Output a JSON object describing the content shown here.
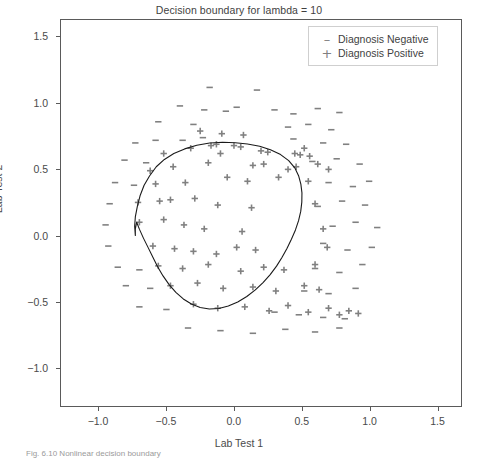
{
  "figure": {
    "width": 478,
    "height": 462,
    "background": "#ffffff",
    "caption": "Fig. 6.10  Nonlinear decision boundary"
  },
  "axis_labels": {
    "x": "Lab Test 1",
    "y": "Lab Test 2"
  },
  "legend": {
    "position": "upper-right",
    "entries": [
      {
        "marker": "minus-marker",
        "glyph": "–",
        "label": "Diagnosis Negative"
      },
      {
        "marker": "plus-marker",
        "glyph": "+",
        "label": "Diagnosis Positive"
      }
    ]
  },
  "colors": {
    "marker": "#808080",
    "boundary": "#1a1a1a",
    "frame": "#5a5a5a",
    "text": "#4a4a4a"
  },
  "chart_data": {
    "type": "scatter",
    "title": "Decision boundary for lambda = 10",
    "xlabel": "Lab Test 1",
    "ylabel": "Lab Test 2",
    "xlim": [
      -1.28,
      1.68
    ],
    "ylim": [
      -1.29,
      1.63
    ],
    "xticks": [
      -1.0,
      -0.5,
      0.0,
      0.5,
      1.0,
      1.5
    ],
    "xticklabels": [
      "−1.0",
      "−0.5",
      "0.0",
      "0.5",
      "1.0",
      "1.5"
    ],
    "yticks": [
      -1.0,
      -0.5,
      0.0,
      0.5,
      1.0,
      1.5
    ],
    "yticklabels": [
      "−1.0",
      "−0.5",
      "0.0",
      "0.5",
      "1.0",
      "1.5"
    ],
    "grid": false,
    "legend_position": "upper right",
    "series": [
      {
        "name": "Diagnosis Positive",
        "marker": "+",
        "color": "#808080",
        "points": [
          [
            -0.25,
            0.79
          ],
          [
            -0.09,
            0.77
          ],
          [
            0.07,
            0.76
          ],
          [
            -0.52,
            0.62
          ],
          [
            -0.32,
            0.66
          ],
          [
            -0.17,
            0.68
          ],
          [
            -0.13,
            0.69
          ],
          [
            0.0,
            0.68
          ],
          [
            0.05,
            0.67
          ],
          [
            -0.1,
            0.62
          ],
          [
            0.2,
            0.64
          ],
          [
            0.25,
            0.63
          ],
          [
            0.45,
            0.62
          ],
          [
            0.49,
            0.61
          ],
          [
            0.52,
            0.66
          ],
          [
            0.56,
            0.6
          ],
          [
            -0.62,
            0.49
          ],
          [
            -0.45,
            0.52
          ],
          [
            -0.19,
            0.55
          ],
          [
            0.14,
            0.53
          ],
          [
            0.22,
            0.54
          ],
          [
            0.4,
            0.5
          ],
          [
            0.46,
            0.52
          ],
          [
            0.62,
            0.54
          ],
          [
            0.7,
            0.5
          ],
          [
            -0.58,
            0.39
          ],
          [
            -0.36,
            0.4
          ],
          [
            -0.05,
            0.44
          ],
          [
            0.1,
            0.41
          ],
          [
            0.33,
            0.44
          ],
          [
            0.55,
            0.41
          ],
          [
            -0.71,
            0.25
          ],
          [
            -0.55,
            0.26
          ],
          [
            -0.47,
            0.27
          ],
          [
            -0.29,
            0.28
          ],
          [
            -0.12,
            0.23
          ],
          [
            0.13,
            0.21
          ],
          [
            0.6,
            0.24
          ],
          [
            -0.7,
            0.1
          ],
          [
            -0.52,
            0.12
          ],
          [
            -0.37,
            0.08
          ],
          [
            -0.22,
            0.05
          ],
          [
            0.06,
            0.03
          ],
          [
            0.66,
            0.05
          ],
          [
            -0.6,
            -0.08
          ],
          [
            -0.44,
            -0.1
          ],
          [
            -0.3,
            -0.12
          ],
          [
            -0.13,
            -0.14
          ],
          [
            0.02,
            -0.09
          ],
          [
            0.16,
            -0.11
          ],
          [
            0.69,
            -0.09
          ],
          [
            -0.56,
            -0.23
          ],
          [
            -0.38,
            -0.25
          ],
          [
            -0.19,
            -0.22
          ],
          [
            0.05,
            -0.27
          ],
          [
            0.22,
            -0.24
          ],
          [
            0.37,
            -0.26
          ],
          [
            0.6,
            -0.22
          ],
          [
            -0.47,
            -0.38
          ],
          [
            -0.27,
            -0.36
          ],
          [
            -0.08,
            -0.4
          ],
          [
            0.14,
            -0.39
          ],
          [
            0.31,
            -0.42
          ],
          [
            0.52,
            -0.38
          ],
          [
            0.63,
            -0.41
          ],
          [
            -0.3,
            -0.52
          ],
          [
            -0.12,
            -0.55
          ],
          [
            0.08,
            -0.54
          ],
          [
            0.26,
            -0.57
          ],
          [
            0.4,
            -0.53
          ],
          [
            0.55,
            -0.58
          ],
          [
            0.7,
            -0.55
          ],
          [
            0.78,
            -0.6
          ],
          [
            0.85,
            -0.57
          ],
          [
            0.92,
            -0.59
          ]
        ]
      },
      {
        "name": "Diagnosis Negative",
        "marker": "–",
        "color": "#808080",
        "points": [
          [
            -0.18,
            1.12
          ],
          [
            0.17,
            1.1
          ],
          [
            -0.4,
            0.98
          ],
          [
            -0.22,
            0.95
          ],
          [
            -0.06,
            0.94
          ],
          [
            0.02,
            0.97
          ],
          [
            0.3,
            0.95
          ],
          [
            0.44,
            0.92
          ],
          [
            0.62,
            0.96
          ],
          [
            0.78,
            0.93
          ],
          [
            -0.56,
            0.86
          ],
          [
            -0.3,
            0.84
          ],
          [
            0.4,
            0.82
          ],
          [
            0.55,
            0.84
          ],
          [
            0.72,
            0.8
          ],
          [
            -0.73,
            0.7
          ],
          [
            -0.58,
            0.72
          ],
          [
            -0.38,
            0.72
          ],
          [
            -0.23,
            0.74
          ],
          [
            0.44,
            0.73
          ],
          [
            0.66,
            0.7
          ],
          [
            0.83,
            0.69
          ],
          [
            -0.81,
            0.57
          ],
          [
            -0.65,
            0.55
          ],
          [
            0.58,
            0.56
          ],
          [
            0.76,
            0.58
          ],
          [
            0.93,
            0.54
          ],
          [
            -0.88,
            0.4
          ],
          [
            -0.74,
            0.38
          ],
          [
            0.7,
            0.4
          ],
          [
            0.88,
            0.37
          ],
          [
            1.0,
            0.41
          ],
          [
            -0.92,
            0.24
          ],
          [
            0.62,
            0.22
          ],
          [
            0.8,
            0.26
          ],
          [
            0.97,
            0.23
          ],
          [
            -0.95,
            0.08
          ],
          [
            0.73,
            0.07
          ],
          [
            0.9,
            0.1
          ],
          [
            1.06,
            0.06
          ],
          [
            -0.93,
            -0.08
          ],
          [
            0.66,
            -0.06
          ],
          [
            0.84,
            -0.11
          ],
          [
            1.02,
            -0.09
          ],
          [
            -0.86,
            -0.24
          ],
          [
            -0.7,
            -0.26
          ],
          [
            0.6,
            -0.25
          ],
          [
            0.78,
            -0.28
          ],
          [
            0.95,
            -0.22
          ],
          [
            -0.8,
            -0.38
          ],
          [
            -0.62,
            -0.4
          ],
          [
            0.52,
            -0.42
          ],
          [
            0.7,
            -0.44
          ],
          [
            0.9,
            -0.4
          ],
          [
            -0.7,
            -0.54
          ],
          [
            -0.5,
            -0.56
          ],
          [
            0.3,
            -0.58
          ],
          [
            0.48,
            -0.6
          ],
          [
            0.66,
            -0.62
          ],
          [
            0.82,
            -0.63
          ],
          [
            -0.34,
            -0.7
          ],
          [
            -0.1,
            -0.72
          ],
          [
            0.14,
            -0.74
          ],
          [
            0.38,
            -0.71
          ],
          [
            0.6,
            -0.73
          ],
          [
            0.78,
            -0.7
          ]
        ]
      }
    ],
    "decision_boundary": {
      "name": "Decision boundary",
      "color": "#1a1a1a",
      "closed": true,
      "lambda": 10,
      "path": [
        [
          -0.73,
          0.0
        ],
        [
          -0.735,
          0.07
        ],
        [
          -0.73,
          0.14
        ],
        [
          -0.715,
          0.22
        ],
        [
          -0.695,
          0.3
        ],
        [
          -0.665,
          0.38
        ],
        [
          -0.625,
          0.45
        ],
        [
          -0.575,
          0.52
        ],
        [
          -0.515,
          0.575
        ],
        [
          -0.445,
          0.62
        ],
        [
          -0.365,
          0.655
        ],
        [
          -0.275,
          0.682
        ],
        [
          -0.18,
          0.7
        ],
        [
          -0.085,
          0.705
        ],
        [
          0.01,
          0.702
        ],
        [
          0.1,
          0.692
        ],
        [
          0.19,
          0.675
        ],
        [
          0.27,
          0.648
        ],
        [
          0.345,
          0.612
        ],
        [
          0.405,
          0.566
        ],
        [
          0.45,
          0.512
        ],
        [
          0.478,
          0.452
        ],
        [
          0.495,
          0.388
        ],
        [
          0.503,
          0.322
        ],
        [
          0.502,
          0.252
        ],
        [
          0.494,
          0.182
        ],
        [
          0.478,
          0.112
        ],
        [
          0.455,
          0.042
        ],
        [
          0.425,
          -0.028
        ],
        [
          0.392,
          -0.098
        ],
        [
          0.355,
          -0.166
        ],
        [
          0.315,
          -0.232
        ],
        [
          0.268,
          -0.296
        ],
        [
          0.215,
          -0.356
        ],
        [
          0.158,
          -0.412
        ],
        [
          0.095,
          -0.462
        ],
        [
          0.028,
          -0.503
        ],
        [
          -0.042,
          -0.534
        ],
        [
          -0.112,
          -0.552
        ],
        [
          -0.182,
          -0.556
        ],
        [
          -0.25,
          -0.545
        ],
        [
          -0.315,
          -0.519
        ],
        [
          -0.375,
          -0.48
        ],
        [
          -0.43,
          -0.43
        ],
        [
          -0.48,
          -0.372
        ],
        [
          -0.525,
          -0.306
        ],
        [
          -0.565,
          -0.236
        ],
        [
          -0.6,
          -0.164
        ],
        [
          -0.635,
          -0.092
        ],
        [
          -0.67,
          -0.02
        ],
        [
          -0.7,
          0.048
        ],
        [
          -0.72,
          0.1
        ],
        [
          -0.73,
          0.05
        ],
        [
          -0.73,
          0.0
        ]
      ]
    }
  }
}
